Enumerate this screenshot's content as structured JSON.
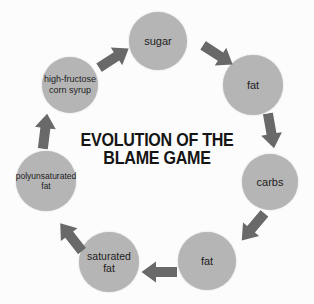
{
  "title": {
    "line1": "EVOLUTION OF THE",
    "line2": "BLAME GAME"
  },
  "colors": {
    "background": "#fcfcfc",
    "circle": "#b5b5b5",
    "arrow": "#696969",
    "text": "#1d1d1d",
    "title_text": "#151515"
  },
  "diagram": {
    "type": "cycle",
    "nodes": [
      {
        "id": "sugar",
        "label": "sugar",
        "x": 158,
        "y": 41,
        "r": 29,
        "font_size": 11
      },
      {
        "id": "fat-1",
        "label": "fat",
        "x": 253,
        "y": 85,
        "r": 30,
        "font_size": 11
      },
      {
        "id": "carbs",
        "label": "carbs",
        "x": 270,
        "y": 182,
        "r": 28,
        "font_size": 11
      },
      {
        "id": "fat-2",
        "label": "fat",
        "x": 207,
        "y": 261,
        "r": 29,
        "font_size": 11
      },
      {
        "id": "saturated-fat",
        "label": "saturated\nfat",
        "x": 109,
        "y": 262,
        "r": 30,
        "font_size": 10.5
      },
      {
        "id": "polyunsaturated-fat",
        "label": "polyunsaturated\nfat",
        "x": 46,
        "y": 181,
        "r": 30,
        "font_size": 8.5
      },
      {
        "id": "high-fructose-corn-syrup",
        "label": "high-fructose\ncorn syrup",
        "x": 70,
        "y": 85,
        "r": 28,
        "font_size": 9
      }
    ],
    "arrows": [
      {
        "id": "sugar-to-fat",
        "x": 218,
        "y": 55,
        "angle": 33
      },
      {
        "id": "fat-to-carbs",
        "x": 271,
        "y": 131,
        "angle": 80
      },
      {
        "id": "carbs-to-fat",
        "x": 253,
        "y": 227,
        "angle": 130
      },
      {
        "id": "fat-to-saturated-fat",
        "x": 159,
        "y": 272,
        "angle": 180
      },
      {
        "id": "saturated-to-polyunsaturated",
        "x": 71,
        "y": 237,
        "angle": -128
      },
      {
        "id": "polyunsaturated-to-hfcs",
        "x": 45,
        "y": 131,
        "angle": -83
      },
      {
        "id": "hfcs-to-sugar",
        "x": 114,
        "y": 58,
        "angle": -33
      }
    ]
  }
}
